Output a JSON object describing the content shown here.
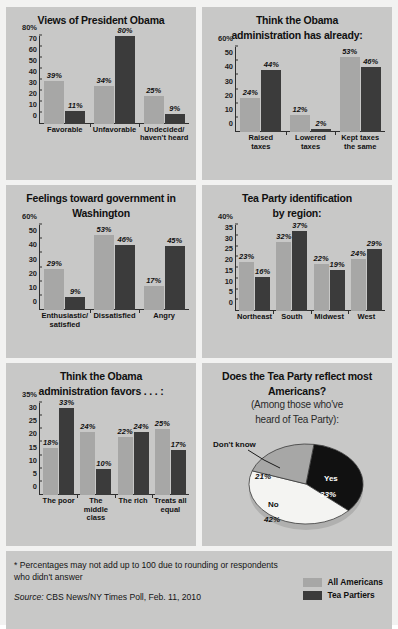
{
  "legend": {
    "items": [
      {
        "label": "All Americans",
        "color": "#a7a7a6"
      },
      {
        "label": "Tea Partiers",
        "color": "#3b3b3b"
      }
    ]
  },
  "footer": {
    "note": "* Percentages may not add up to 100 due to rounding or respondents who didn't answer",
    "source_prefix": "Source:",
    "source_text": "CBS News/NY Times Poll, Feb. 11, 2010"
  },
  "chart_data": [
    {
      "id": "views-of-president-obama",
      "type": "bar",
      "title": "Views of President Obama",
      "subtitle": "",
      "categories": [
        "Favorable",
        "Unfavorable",
        "Undecided/\nhaven't heard"
      ],
      "series": [
        {
          "name": "All Americans",
          "color": "#a7a7a6",
          "values": [
            39,
            34,
            25
          ],
          "labels": [
            "39%",
            "34%",
            "25%"
          ]
        },
        {
          "name": "Tea Partiers",
          "color": "#3b3b3b",
          "values": [
            11,
            80,
            9
          ],
          "labels": [
            "11%",
            "80%",
            "9%"
          ]
        }
      ],
      "ylim": [
        0,
        80
      ],
      "yticks": [
        80,
        70,
        60,
        50,
        40,
        30,
        20,
        10,
        0
      ],
      "yticklabels": [
        "80%",
        "70",
        "60",
        "50",
        "40",
        "30",
        "20",
        "10",
        "0"
      ],
      "ylabel": "",
      "xlabel": "",
      "grid": false
    },
    {
      "id": "administration-has-already",
      "type": "bar",
      "title": "Think the Obama administration has already:",
      "subtitle": "",
      "categories": [
        "Raised\ntaxes",
        "Lowered\ntaxes",
        "Kept taxes\nthe same"
      ],
      "series": [
        {
          "name": "All Americans",
          "color": "#a7a7a6",
          "values": [
            24,
            12,
            53
          ],
          "labels": [
            "24%",
            "12%",
            "53%"
          ]
        },
        {
          "name": "Tea Partiers",
          "color": "#3b3b3b",
          "values": [
            44,
            2,
            46
          ],
          "labels": [
            "44%",
            "2%",
            "46%"
          ]
        }
      ],
      "ylim": [
        0,
        60
      ],
      "yticks": [
        60,
        50,
        40,
        30,
        20,
        10,
        0
      ],
      "yticklabels": [
        "60%",
        "50",
        "40",
        "30",
        "20",
        "10",
        "0"
      ],
      "ylabel": "",
      "xlabel": "",
      "grid": false
    },
    {
      "id": "feelings-toward-government",
      "type": "bar",
      "title": "Feelings toward government in Washington",
      "subtitle": "",
      "categories": [
        "Enthusiastic/\nsatisfied",
        "Dissatisfied",
        "Angry"
      ],
      "series": [
        {
          "name": "All Americans",
          "color": "#a7a7a6",
          "values": [
            29,
            53,
            17
          ],
          "labels": [
            "29%",
            "53%",
            "17%"
          ]
        },
        {
          "name": "Tea Partiers",
          "color": "#3b3b3b",
          "values": [
            9,
            46,
            45
          ],
          "labels": [
            "9%",
            "46%",
            "45%"
          ]
        }
      ],
      "ylim": [
        0,
        60
      ],
      "yticks": [
        60,
        50,
        40,
        30,
        20,
        10,
        0
      ],
      "yticklabels": [
        "60%",
        "50",
        "40",
        "30",
        "20",
        "10",
        "0"
      ],
      "ylabel": "",
      "xlabel": "",
      "grid": false
    },
    {
      "id": "tea-party-identification-by-region",
      "type": "bar",
      "title": "Tea Party identification by region:",
      "subtitle": "",
      "categories": [
        "Northeast",
        "South",
        "Midwest",
        "West"
      ],
      "series": [
        {
          "name": "All Americans",
          "color": "#a7a7a6",
          "values": [
            23,
            32,
            22,
            24
          ],
          "labels": [
            "23%",
            "32%",
            "22%",
            "24%"
          ]
        },
        {
          "name": "Tea Partiers",
          "color": "#3b3b3b",
          "values": [
            16,
            37,
            19,
            29
          ],
          "labels": [
            "16%",
            "37%",
            "19%",
            "29%"
          ]
        }
      ],
      "ylim": [
        0,
        40
      ],
      "yticks": [
        40,
        35,
        30,
        25,
        20,
        15,
        10,
        5,
        0
      ],
      "yticklabels": [
        "40%",
        "35",
        "30",
        "25",
        "20",
        "15",
        "10",
        "5",
        "0"
      ],
      "ylabel": "",
      "xlabel": "",
      "grid": false
    },
    {
      "id": "administration-favors",
      "type": "bar",
      "title": "Think the Obama administration favors . . . :",
      "subtitle": "",
      "categories": [
        "The poor",
        "The\nmiddle\nclass",
        "The rich",
        "Treats all\nequal"
      ],
      "series": [
        {
          "name": "All Americans",
          "color": "#a7a7a6",
          "values": [
            18,
            24,
            22,
            25
          ],
          "labels": [
            "18%",
            "24%",
            "22%",
            "25%"
          ]
        },
        {
          "name": "Tea Partiers",
          "color": "#3b3b3b",
          "values": [
            33,
            10,
            24,
            17
          ],
          "labels": [
            "33%",
            "10%",
            "24%",
            "17%"
          ]
        }
      ],
      "ylim": [
        0,
        35
      ],
      "yticks": [
        35,
        30,
        25,
        20,
        15,
        10,
        5,
        0
      ],
      "yticklabels": [
        "35%",
        "30",
        "25",
        "20",
        "15",
        "10",
        "5",
        "0"
      ],
      "ylabel": "",
      "xlabel": "",
      "grid": false
    },
    {
      "id": "does-tea-party-reflect-most-americans",
      "type": "pie",
      "title": "Does the Tea Party reflect most Americans?",
      "subtitle": "(Among those who've heard of Tea Party):",
      "categories": [
        "Yes",
        "No",
        "Don't know"
      ],
      "values": [
        33,
        42,
        21
      ],
      "labels": [
        "33%",
        "42%",
        "21%"
      ],
      "colors": [
        "#111111",
        "#f4f4f2",
        "#a7a7a6"
      ],
      "legend_position": "in-slice"
    }
  ],
  "panels": {
    "p1": {
      "title": "Views of President Obama"
    },
    "p2": {
      "title_line1": "Think the Obama",
      "title_line2": "administration has already:"
    },
    "p3": {
      "title_line1": "Feelings toward government in",
      "title_line2": "Washington"
    },
    "p4": {
      "title_line1": "Tea Party identification",
      "title_line2": "by region:"
    },
    "p5": {
      "title_line1": "Think the Obama",
      "title_line2": "administration favors . . . :"
    },
    "p6": {
      "title_line1": "Does the Tea Party reflect most",
      "title_line2": "Americans?",
      "sub_line1": "(Among those who've",
      "sub_line2": "heard of Tea Party):",
      "slice_yes_name": "Yes",
      "slice_yes_pct": "33%",
      "slice_no_name": "No",
      "slice_no_pct": "42%",
      "slice_dk_name": "Don't know",
      "slice_dk_pct": "21%"
    }
  }
}
